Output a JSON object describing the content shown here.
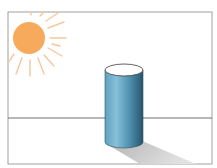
{
  "scene": {
    "description": "Illustration of a sun shining on a blue cylinder casting a shadow",
    "colors": {
      "background": "#ffffff",
      "frame": "#9a9a9a",
      "sun": "#f7a95c",
      "sun_rays": "#f5c79a",
      "horizon": "#6e6e6e",
      "cylinder_light": "#7fb9d3",
      "cylinder_mid": "#4f92b3",
      "cylinder_dark": "#2c5f78",
      "cylinder_top": "#ffffff",
      "shadow": "#c9c9c9"
    }
  }
}
